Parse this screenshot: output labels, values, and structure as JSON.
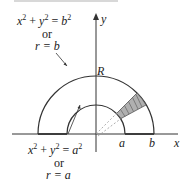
{
  "labels": {
    "outer_eq": {
      "x": "x",
      "y": "y",
      "rhs": "b",
      "exp": "2"
    },
    "outer_or": "or",
    "outer_polar": "r = b",
    "inner_eq": {
      "x": "x",
      "y": "y",
      "rhs": "a",
      "exp": "2"
    },
    "inner_or": "or",
    "inner_polar": "r = a",
    "region": "R",
    "axis_x": "x",
    "axis_y": "y",
    "tick_a": "a",
    "tick_b": "b"
  },
  "colors": {
    "stroke": "#333333",
    "shade": "#b0b0b0",
    "dashed": "#999999"
  }
}
